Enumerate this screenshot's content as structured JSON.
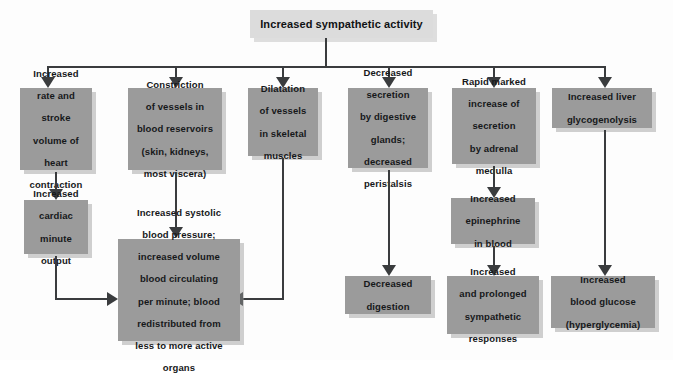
{
  "diagram": {
    "title_box": {
      "label": "Increased sympathetic activity"
    },
    "colors": {
      "box_fill": "#9b9b9b",
      "title_fill": "#dcdcdc",
      "connector": "#3a3c3e",
      "background": "#fdfdfd",
      "text": "#16181a"
    },
    "row1": [
      {
        "id": "heart",
        "lines": [
          "Increased",
          "rate and",
          "stroke",
          "volume of",
          "heart",
          "contraction"
        ]
      },
      {
        "id": "constriction",
        "lines": [
          "Constriction",
          "of vessels in",
          "blood reservoirs",
          "(skin, kidneys,",
          "most viscera)"
        ]
      },
      {
        "id": "dilatation",
        "lines": [
          "Dilatation",
          "of vessels",
          "in skeletal",
          "muscles"
        ]
      },
      {
        "id": "digestive",
        "lines": [
          "Decreased",
          "secretion",
          "by digestive",
          "glands;",
          "decreased",
          "peristalsis"
        ]
      },
      {
        "id": "adrenal",
        "lines": [
          "Rapid marked",
          "increase of",
          "secretion",
          "by adrenal",
          "medulla"
        ]
      },
      {
        "id": "liver",
        "lines": [
          "Increased liver",
          "glycogenolysis"
        ]
      }
    ],
    "row2": [
      {
        "id": "cardiac-output",
        "lines": [
          "Increased",
          "cardiac",
          "minute",
          "output"
        ]
      },
      {
        "id": "epinephrine",
        "lines": [
          "Increased",
          "epinephrine",
          "in blood"
        ]
      }
    ],
    "row3": [
      {
        "id": "blood-pressure",
        "lines": [
          "Increased systolic",
          "blood pressure;",
          "increased volume",
          "blood circulating",
          "per minute; blood",
          "redistributed from",
          "less to more active",
          "organs"
        ]
      },
      {
        "id": "digestion",
        "lines": [
          "Decreased",
          "digestion"
        ]
      },
      {
        "id": "sympathetic",
        "lines": [
          "Increased",
          "and prolonged",
          "sympathetic",
          "responses"
        ]
      },
      {
        "id": "glucose",
        "lines": [
          "Increased",
          "blood glucose",
          "(hyperglycemia)"
        ]
      }
    ]
  }
}
